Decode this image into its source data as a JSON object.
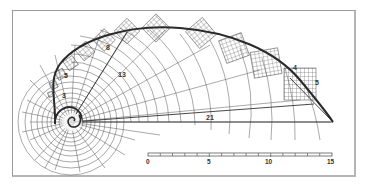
{
  "figure": {
    "labels": {
      "square_21": "21",
      "square_13": "13",
      "square_8": "8",
      "square_5": "5",
      "square_3": "3",
      "edge_4": "4",
      "edge_5": "5"
    },
    "scale_bar": {
      "ticks": [
        "0",
        "5",
        "10",
        "15"
      ],
      "min": 0,
      "max": 15,
      "minor_divisions": 15
    },
    "colors": {
      "line": "#333333",
      "grid": "#555555",
      "frame": "#9a9a9a",
      "background": "#ffffff"
    }
  }
}
